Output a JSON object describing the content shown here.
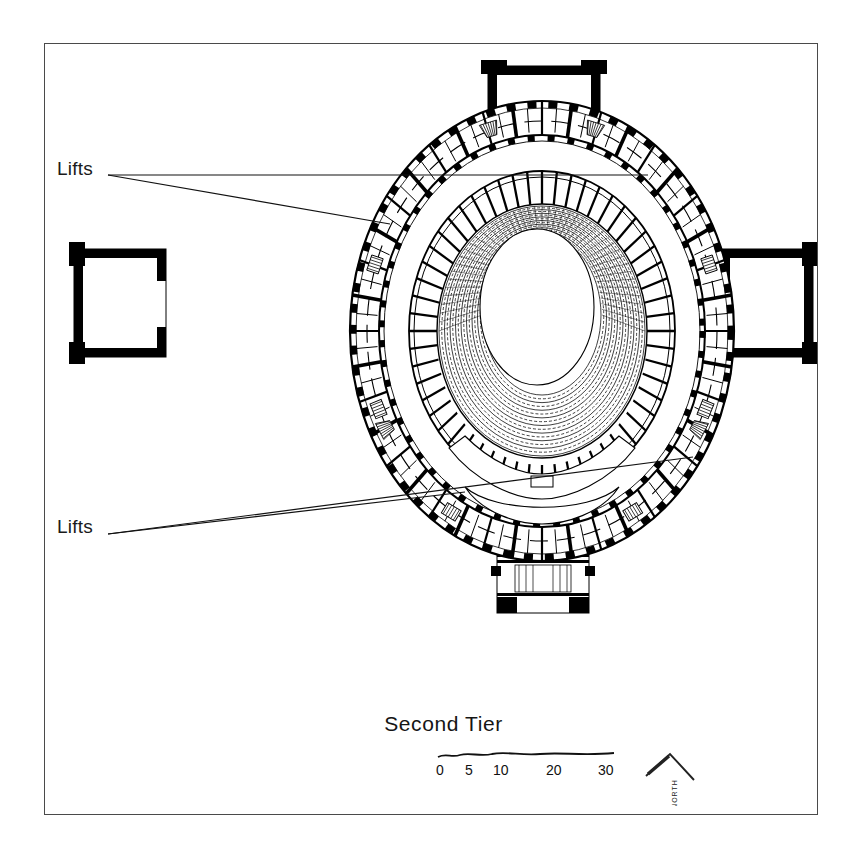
{
  "drawing": {
    "kind": "architectural-floor-plan",
    "subject": "Elliptical concert hall — second tier plan",
    "title": "Second Tier",
    "frame": {
      "border_color": "#4a4a4a"
    },
    "ink_color": "#000000",
    "paper_color": "#ffffff"
  },
  "annotations": [
    {
      "id": "lifts-top",
      "label": "Lifts",
      "leader_count": 2
    },
    {
      "id": "lifts-bot",
      "label": "Lifts",
      "leader_count": 2
    }
  ],
  "scale_bar": {
    "units_note": "",
    "ticks": [
      {
        "label": "0",
        "value": 0
      },
      {
        "label": "5",
        "value": 5
      },
      {
        "label": "10",
        "value": 10
      },
      {
        "label": "20",
        "value": 20
      },
      {
        "label": "30",
        "value": 30
      }
    ]
  },
  "north_arrow": {
    "label": "NORTH",
    "icon": "north-chevron-icon"
  },
  "plan": {
    "center": {
      "x": 541,
      "y": 330
    },
    "outer_ellipse": {
      "rx": 192,
      "ry": 230
    },
    "corridor_ellipse": {
      "rx": 163,
      "ry": 196
    },
    "auditorium_ellipse": {
      "rx": 133,
      "ry": 160
    },
    "arena_ellipse": {
      "rx": 57,
      "ry": 78
    },
    "seating_rows": 17,
    "box_divisions": 56,
    "projections": [
      {
        "name": "north-portico",
        "position": "top"
      },
      {
        "name": "west-pavilion",
        "position": "left"
      },
      {
        "name": "east-pavilion",
        "position": "right"
      },
      {
        "name": "south-vestibule",
        "position": "bottom"
      }
    ]
  }
}
